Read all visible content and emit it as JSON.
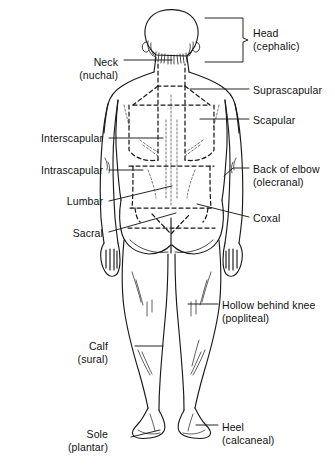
{
  "figure": {
    "view": "posterior",
    "stroke_color": "#1a1a1a",
    "background_color": "#ffffff",
    "dashed_region_color": "#1a1a1a"
  },
  "labels": [
    {
      "id": "head",
      "common": "Head",
      "latin": "(cephalic)",
      "side": "right",
      "text_x": 253,
      "text_y": 27,
      "leader": "brace"
    },
    {
      "id": "neck",
      "common": "Neck",
      "latin": "(nuchal)",
      "side": "left",
      "text_x": 118,
      "text_y": 56,
      "leader": "line"
    },
    {
      "id": "suprascap",
      "common": "Suprascapular",
      "latin": "",
      "side": "right",
      "text_x": 253,
      "text_y": 84,
      "leader": "line"
    },
    {
      "id": "scapular",
      "common": "Scapular",
      "latin": "",
      "side": "right",
      "text_x": 253,
      "text_y": 114,
      "leader": "line"
    },
    {
      "id": "interscap",
      "common": "Interscapular",
      "latin": "",
      "side": "left",
      "text_x": 103,
      "text_y": 132,
      "leader": "line"
    },
    {
      "id": "intrascap",
      "common": "Intrascapular",
      "latin": "",
      "side": "left",
      "text_x": 103,
      "text_y": 164,
      "leader": "line"
    },
    {
      "id": "elbow",
      "common": "Back of elbow",
      "latin": "(olecranal)",
      "side": "right",
      "text_x": 253,
      "text_y": 163,
      "leader": "line"
    },
    {
      "id": "lumbar",
      "common": "Lumbar",
      "latin": "",
      "side": "left",
      "text_x": 103,
      "text_y": 195,
      "leader": "line"
    },
    {
      "id": "coxal",
      "common": "Coxal",
      "latin": "",
      "side": "right",
      "text_x": 253,
      "text_y": 212,
      "leader": "line"
    },
    {
      "id": "sacral",
      "common": "Sacral",
      "latin": "",
      "side": "left",
      "text_x": 103,
      "text_y": 227,
      "leader": "line"
    },
    {
      "id": "popliteal",
      "common": "Hollow behind knee",
      "latin": "(popliteal)",
      "side": "right",
      "text_x": 222,
      "text_y": 299,
      "leader": "line"
    },
    {
      "id": "calf",
      "common": "Calf",
      "latin": "(sural)",
      "side": "left",
      "text_x": 108,
      "text_y": 340,
      "leader": "line"
    },
    {
      "id": "heel",
      "common": "Heel",
      "latin": "(calcaneal)",
      "side": "right",
      "text_x": 222,
      "text_y": 421,
      "leader": "line"
    },
    {
      "id": "sole",
      "common": "Sole",
      "latin": "(plantar)",
      "side": "left",
      "text_x": 108,
      "text_y": 428,
      "leader": "line"
    }
  ]
}
